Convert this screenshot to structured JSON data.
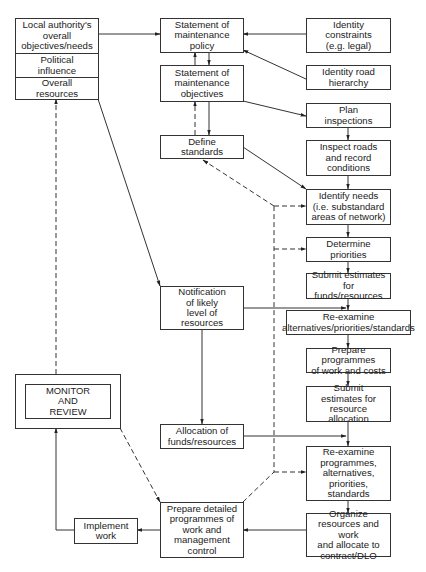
{
  "diagram": {
    "type": "flowchart",
    "left_stack": {
      "cells": [
        "Local authority's\noverall\nobjectives/needs",
        "Political\ninfluence",
        "Overall\nresources"
      ]
    },
    "nodes": {
      "policy": "Statement of\nmaintenance\npolicy",
      "constraints": "Identity\nconstraints\n(e.g. legal)",
      "objectives": "Statement of\nmaintenance\nobjectives",
      "hierarchy": "Identity road\nhierarchy",
      "plan_inspections": "Plan\ninspections",
      "define_standards": "Define\nstandards",
      "inspect_roads": "Inspect roads\nand record\nconditions",
      "identify_needs": "Identify needs\n(i.e. substandard\nareas of network)",
      "determine_priorities": "Determine\npriorities",
      "submit_funds": "Submit estimates\nfor funds/resources",
      "notification": "Notification\nof likely\nlevel of\nresources",
      "reexamine_alternatives": "Re-examine\nalternatives/priorities/standards",
      "prepare_programmes": "Prepare programmes\nof work and costs",
      "submit_allocation": "Submit\nestimates for\nresource allocation",
      "monitor_review": "MONITOR\nAND\nREVIEW",
      "allocation": "Allocation of\nfunds/resources",
      "reexamine_programmes": "Re-examine\nprogrammes,\nalternatives,\npriorities,\nstandards",
      "prepare_detailed": "Prepare detailed\nprogrammes of\nwork and\nmanagement\ncontrol",
      "implement_work": "Implement\nwork",
      "organize_resources": "Organize\nresources and work\nand allocate to\ncontract/DLO"
    },
    "edges": [
      {
        "from": "local_authority",
        "to": "policy",
        "style": "solid"
      },
      {
        "from": "constraints",
        "to": "policy",
        "style": "solid"
      },
      {
        "from": "hierarchy",
        "to": "policy",
        "style": "solid"
      },
      {
        "from": "policy",
        "to": "objectives",
        "style": "solid",
        "bidirectional": true
      },
      {
        "from": "objectives",
        "to": "define_standards",
        "style": "solid"
      },
      {
        "from": "define_standards",
        "to": "objectives",
        "style": "dashed"
      },
      {
        "from": "objectives",
        "to": "plan_inspections",
        "style": "solid"
      },
      {
        "from": "plan_inspections",
        "to": "inspect_roads",
        "style": "solid"
      },
      {
        "from": "inspect_roads",
        "to": "identify_needs",
        "style": "solid"
      },
      {
        "from": "define_standards",
        "to": "identify_needs",
        "style": "solid"
      },
      {
        "from": "identify_needs",
        "to": "determine_priorities",
        "style": "solid"
      },
      {
        "from": "determine_priorities",
        "to": "submit_funds",
        "style": "solid"
      },
      {
        "from": "overall_resources",
        "to": "notification",
        "style": "solid"
      },
      {
        "from": "submit_funds",
        "to": "reexamine_alternatives",
        "style": "solid"
      },
      {
        "from": "notification",
        "to": "reexamine_alternatives",
        "style": "solid"
      },
      {
        "from": "reexamine_alternatives",
        "to": "prepare_programmes",
        "style": "solid"
      },
      {
        "from": "prepare_programmes",
        "to": "submit_allocation",
        "style": "solid"
      },
      {
        "from": "notification",
        "to": "allocation",
        "style": "solid"
      },
      {
        "from": "submit_allocation",
        "to": "reexamine_programmes",
        "style": "solid"
      },
      {
        "from": "allocation",
        "to": "reexamine_programmes",
        "style": "solid"
      },
      {
        "from": "reexamine_programmes",
        "to": "organize_resources",
        "style": "solid"
      },
      {
        "from": "organize_resources",
        "to": "prepare_detailed",
        "style": "solid"
      },
      {
        "from": "prepare_detailed",
        "to": "implement_work",
        "style": "solid"
      },
      {
        "from": "implement_work",
        "to": "monitor_review",
        "style": "solid"
      },
      {
        "from": "monitor_review",
        "to": "overall_resources",
        "style": "dashed"
      },
      {
        "from": "monitor_review",
        "to": "prepare_detailed",
        "style": "dashed"
      },
      {
        "from": "feedback_bus",
        "to": "define_standards",
        "style": "dashed"
      },
      {
        "from": "feedback_bus",
        "to": "identify_needs",
        "style": "dashed"
      },
      {
        "from": "feedback_bus",
        "to": "determine_priorities",
        "style": "dashed"
      },
      {
        "from": "feedback_bus",
        "to": "reexamine_programmes",
        "style": "dashed"
      },
      {
        "from": "prepare_detailed",
        "to": "feedback_bus",
        "style": "dashed"
      }
    ]
  }
}
